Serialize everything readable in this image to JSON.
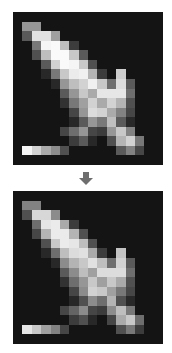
{
  "background": "#141414",
  "arrow_color": "#6e6e6e",
  "grid_size": 16,
  "sprites": {
    "before": [
      [
        20,
        20,
        20,
        20,
        20,
        20,
        20,
        20,
        20,
        20,
        20,
        20,
        20,
        20,
        20,
        20
      ],
      [
        20,
        150,
        150,
        20,
        20,
        20,
        20,
        20,
        20,
        20,
        20,
        20,
        20,
        20,
        20,
        20
      ],
      [
        20,
        90,
        225,
        225,
        160,
        20,
        20,
        20,
        20,
        20,
        20,
        20,
        20,
        20,
        20,
        20
      ],
      [
        20,
        20,
        120,
        245,
        250,
        190,
        60,
        20,
        20,
        20,
        20,
        20,
        20,
        20,
        20,
        20
      ],
      [
        20,
        20,
        80,
        190,
        250,
        250,
        200,
        90,
        20,
        20,
        20,
        20,
        20,
        20,
        20,
        20
      ],
      [
        20,
        20,
        20,
        90,
        210,
        250,
        245,
        200,
        80,
        20,
        20,
        20,
        20,
        20,
        20,
        20
      ],
      [
        20,
        20,
        20,
        40,
        120,
        200,
        235,
        240,
        180,
        60,
        20,
        205,
        20,
        20,
        20,
        20
      ],
      [
        20,
        20,
        20,
        20,
        40,
        150,
        190,
        210,
        240,
        200,
        110,
        220,
        90,
        20,
        20,
        20
      ],
      [
        20,
        20,
        20,
        20,
        20,
        90,
        150,
        200,
        170,
        230,
        230,
        230,
        110,
        20,
        20,
        20
      ],
      [
        20,
        20,
        20,
        20,
        20,
        50,
        120,
        160,
        210,
        170,
        210,
        180,
        80,
        20,
        20,
        20
      ],
      [
        20,
        20,
        20,
        20,
        20,
        20,
        70,
        150,
        220,
        210,
        170,
        130,
        70,
        20,
        20,
        20
      ],
      [
        20,
        20,
        20,
        20,
        20,
        20,
        40,
        90,
        150,
        120,
        190,
        90,
        40,
        20,
        20,
        20
      ],
      [
        20,
        20,
        20,
        20,
        20,
        70,
        110,
        150,
        70,
        60,
        150,
        200,
        130,
        20,
        20,
        20
      ],
      [
        20,
        20,
        20,
        20,
        20,
        20,
        60,
        90,
        40,
        20,
        80,
        180,
        210,
        120,
        20,
        20
      ],
      [
        20,
        245,
        210,
        170,
        140,
        80,
        20,
        20,
        20,
        20,
        20,
        90,
        130,
        70,
        20,
        20
      ],
      [
        20,
        20,
        20,
        20,
        20,
        20,
        20,
        20,
        20,
        20,
        20,
        20,
        20,
        20,
        20,
        20
      ]
    ],
    "after": [
      [
        20,
        20,
        20,
        20,
        20,
        20,
        20,
        20,
        20,
        20,
        20,
        20,
        20,
        20,
        20,
        20
      ],
      [
        20,
        130,
        130,
        20,
        20,
        20,
        20,
        20,
        20,
        20,
        20,
        20,
        20,
        20,
        20,
        20
      ],
      [
        20,
        80,
        215,
        215,
        140,
        20,
        20,
        20,
        20,
        20,
        20,
        20,
        20,
        20,
        20,
        20
      ],
      [
        20,
        20,
        110,
        230,
        235,
        170,
        60,
        20,
        20,
        20,
        20,
        20,
        20,
        20,
        20,
        20
      ],
      [
        20,
        20,
        70,
        180,
        235,
        235,
        180,
        80,
        20,
        20,
        20,
        20,
        20,
        20,
        20,
        20
      ],
      [
        20,
        20,
        20,
        80,
        200,
        235,
        230,
        190,
        80,
        20,
        20,
        20,
        20,
        20,
        20,
        20
      ],
      [
        20,
        20,
        20,
        40,
        110,
        190,
        220,
        225,
        170,
        60,
        20,
        195,
        20,
        20,
        20,
        20
      ],
      [
        20,
        20,
        20,
        20,
        40,
        140,
        180,
        200,
        225,
        190,
        110,
        210,
        90,
        20,
        20,
        20
      ],
      [
        20,
        20,
        20,
        20,
        20,
        90,
        140,
        190,
        160,
        220,
        220,
        220,
        110,
        20,
        20,
        20
      ],
      [
        20,
        20,
        20,
        20,
        20,
        50,
        110,
        150,
        200,
        160,
        200,
        170,
        80,
        20,
        20,
        20
      ],
      [
        20,
        20,
        20,
        20,
        20,
        20,
        70,
        140,
        210,
        200,
        160,
        120,
        70,
        20,
        20,
        20
      ],
      [
        20,
        20,
        20,
        20,
        20,
        20,
        40,
        80,
        140,
        110,
        180,
        80,
        40,
        20,
        20,
        20
      ],
      [
        20,
        20,
        20,
        20,
        20,
        70,
        100,
        140,
        70,
        60,
        140,
        190,
        120,
        20,
        20,
        20
      ],
      [
        20,
        20,
        20,
        20,
        20,
        20,
        60,
        80,
        40,
        20,
        70,
        170,
        200,
        110,
        20,
        20
      ],
      [
        20,
        230,
        200,
        160,
        130,
        70,
        20,
        20,
        20,
        20,
        20,
        80,
        120,
        60,
        20,
        20
      ],
      [
        20,
        20,
        20,
        20,
        20,
        20,
        20,
        20,
        20,
        20,
        20,
        20,
        20,
        20,
        20,
        20
      ]
    ]
  }
}
